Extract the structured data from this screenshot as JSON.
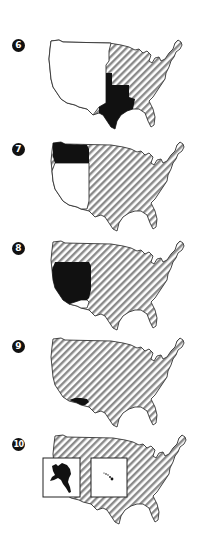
{
  "figure": {
    "panels": [
      {
        "number": "6",
        "label": "Panel 6",
        "highlight": "texas-annexation",
        "unacquired": "western-territory",
        "hatched": "existing-states"
      },
      {
        "number": "7",
        "label": "Panel 7",
        "highlight": "oregon-territory",
        "unacquired": "mexican-cession-area",
        "hatched": "existing-states"
      },
      {
        "number": "8",
        "label": "Panel 8",
        "highlight": "mexican-cession",
        "unacquired": "gadsden-area",
        "hatched": "existing-states"
      },
      {
        "number": "9",
        "label": "Panel 9",
        "highlight": "gadsden-purchase",
        "unacquired": "",
        "hatched": "existing-states"
      },
      {
        "number": "10",
        "label": "Panel 10",
        "highlight": "alaska-and-hawaii",
        "unacquired": "",
        "hatched": "existing-states"
      }
    ],
    "colors": {
      "highlight": "#111111",
      "hatch_stripe": "#8a8a8a",
      "hatch_bg": "#ffffff",
      "outline": "#333333",
      "unacquired": "#ffffff"
    }
  }
}
